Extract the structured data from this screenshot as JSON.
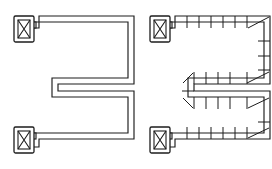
{
  "document": {
    "title": "Cable Tray Serpentine Routing",
    "background_color": "#ffffff",
    "line_color": "#1c1c1c",
    "width": 272,
    "height": 169
  },
  "figures": [
    {
      "id": "left-figure",
      "name": "plain-outline-routing",
      "label": "Plain outline serpentine tray run",
      "segmented": false,
      "terminals": [
        {
          "name": "top-junction-box",
          "symbol": "crossed-box",
          "x": 14,
          "y": 16,
          "width": 20,
          "height": 26
        },
        {
          "name": "bottom-junction-box",
          "symbol": "crossed-box",
          "x": 14,
          "y": 127,
          "width": 20,
          "height": 26
        }
      ]
    },
    {
      "id": "right-figure",
      "name": "segmented-routing",
      "label": "Segmented tray run with corner fittings",
      "segmented": true,
      "terminals": [
        {
          "name": "top-junction-box",
          "symbol": "crossed-box",
          "x": 150,
          "y": 16,
          "width": 20,
          "height": 26
        },
        {
          "name": "bottom-junction-box",
          "symbol": "crossed-box",
          "x": 150,
          "y": 127,
          "width": 20,
          "height": 26
        }
      ],
      "counts": {
        "straight_segments_top_run": 6,
        "straight_segments_middle_run": 4,
        "straight_segments_third_run": 4,
        "straight_segments_bottom_run": 6,
        "corner_fittings": 4
      }
    }
  ],
  "symbols": {
    "crossed_box": {
      "name": "crossed-box-terminal",
      "description": "Rectangular junction box with X diagonal cross"
    },
    "corner_fitting": {
      "name": "corner-fitting",
      "description": "Square tray corner piece marked with a single diagonal"
    },
    "divider": {
      "name": "segment-divider",
      "description": "Transverse line separating straight tray lengths"
    }
  }
}
